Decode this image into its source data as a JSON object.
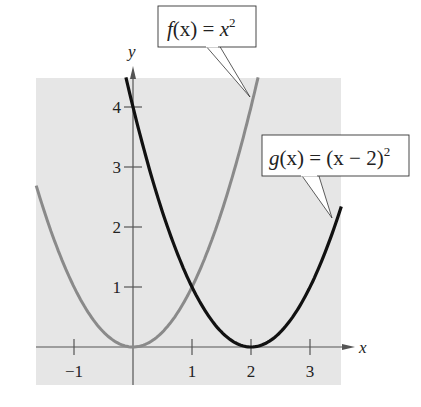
{
  "chart_data": {
    "type": "line",
    "title": "",
    "xlabel": "x",
    "ylabel": "y",
    "xlim": [
      -1.64,
      3.53
    ],
    "ylim": [
      -0.63,
      4.48
    ],
    "x_ticks": [
      -1,
      1,
      2,
      3
    ],
    "x_tick_labels": [
      "−1",
      "1",
      "2",
      "3"
    ],
    "y_ticks": [
      1,
      2,
      3,
      4
    ],
    "y_tick_labels": [
      "1",
      "2",
      "3",
      "4"
    ],
    "grid": false,
    "background": "#e6e6e6",
    "series": [
      {
        "name": "f(x) = x²",
        "expression": "x^2",
        "color": "#8a8a8a",
        "x": [
          -1.64,
          -1.5,
          -1,
          -0.5,
          0,
          0.5,
          1,
          1.5,
          2,
          2.12
        ],
        "y": [
          2.69,
          2.25,
          1,
          0.25,
          0,
          0.25,
          1,
          2.25,
          4,
          4.49
        ]
      },
      {
        "name": "g(x) = (x − 2)²",
        "expression": "(x-2)^2",
        "color": "#111111",
        "x": [
          -0.12,
          0,
          0.5,
          1,
          1.5,
          2,
          2.5,
          3,
          3.5,
          3.53
        ],
        "y": [
          4.49,
          4,
          2.25,
          1,
          0.25,
          0,
          0.25,
          1,
          2.25,
          2.34
        ]
      }
    ],
    "annotations": [
      {
        "text": "f(x) = x²",
        "points_to": [
          2.05,
          4.2
        ]
      },
      {
        "text": "g(x) = (x − 2)²",
        "points_to": [
          3.45,
          2.1
        ]
      }
    ],
    "legend_position": "callouts"
  },
  "labels": {
    "x_axis": "x",
    "y_axis": "y",
    "f_callout": {
      "name": "f",
      "arg": "(x)",
      "eq": " = ",
      "body": "x",
      "sup": "2"
    },
    "g_callout": {
      "name": "g",
      "arg": "(x)",
      "eq": " = ",
      "body": "(x − 2)",
      "sup": "2"
    }
  }
}
